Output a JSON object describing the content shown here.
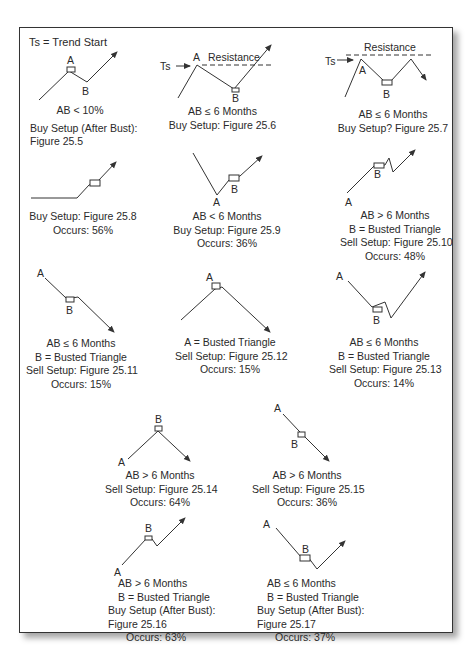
{
  "legend": "Ts = Trend Start",
  "labels": {
    "A": "A",
    "B": "B",
    "Ts": "Ts",
    "resistance": "Resistance"
  },
  "panels": [
    {
      "id": "25.5",
      "lines": [
        "AB < 10%",
        "Buy Setup (After Bust):",
        "Figure 25.5"
      ]
    },
    {
      "id": "25.6",
      "lines": [
        "AB ≤ 6 Months",
        "Buy Setup: Figure 25.6"
      ]
    },
    {
      "id": "25.7",
      "lines": [
        "AB ≤ 6 Months",
        "Buy Setup? Figure 25.7"
      ]
    },
    {
      "id": "25.8",
      "lines": [
        "Buy Setup: Figure 25.8",
        "Occurs: 56%"
      ]
    },
    {
      "id": "25.9",
      "lines": [
        "AB < 6 Months",
        "Buy Setup: Figure 25.9",
        "Occurs: 36%"
      ]
    },
    {
      "id": "25.10",
      "lines": [
        "AB > 6 Months",
        "B = Busted Triangle",
        "Sell Setup: Figure 25.10",
        "Occurs: 48%"
      ]
    },
    {
      "id": "25.11",
      "lines": [
        "AB ≤ 6 Months",
        "B = Busted Triangle",
        "Sell Setup: Figure 25.11",
        "Occurs: 15%"
      ]
    },
    {
      "id": "25.12",
      "lines": [
        "A = Busted Triangle",
        "Sell Setup: Figure 25.12",
        "Occurs: 15%"
      ]
    },
    {
      "id": "25.13",
      "lines": [
        "AB ≤ 6 Months",
        "B = Busted Triangle",
        "Sell Setup: Figure 25.13",
        "Occurs: 14%"
      ]
    },
    {
      "id": "25.14",
      "lines": [
        "AB > 6 Months",
        "Sell Setup: Figure 25.14",
        "Occurs: 64%"
      ]
    },
    {
      "id": "25.15",
      "lines": [
        "AB > 6 Months",
        "Sell Setup: Figure 25.15",
        "Occurs: 36%"
      ]
    },
    {
      "id": "25.16",
      "lines": [
        "AB > 6 Months",
        "B = Busted Triangle",
        "Buy Setup (After Bust):",
        "Figure 25.16",
        "Occurs: 63%"
      ]
    },
    {
      "id": "25.17",
      "lines": [
        "AB ≤ 6 Months",
        "B = Busted Triangle",
        "Buy Setup (After Bust):",
        "Figure 25.17",
        "Occurs: 37%"
      ]
    }
  ],
  "colors": {
    "line": "#333333",
    "frame": "#333333",
    "text": "#2a2a2a"
  }
}
